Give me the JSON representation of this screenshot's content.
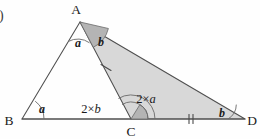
{
  "figure": {
    "kind": "geometry-diagram",
    "list_marker": ")",
    "background_color": "#fefefe",
    "line_color": "#4f4f4f",
    "shade_color": "#d8d8d8",
    "shade_dark_color": "#b4b4b4",
    "vertices": [
      {
        "id": "A",
        "label": "A",
        "x": 80,
        "y": 22,
        "label_x": 76,
        "label_y": 14
      },
      {
        "id": "B",
        "label": "B",
        "x": 22,
        "y": 119,
        "label_x": 7,
        "label_y": 124
      },
      {
        "id": "C",
        "label": "C",
        "x": 131,
        "y": 119,
        "label_x": 127,
        "label_y": 136
      },
      {
        "id": "D",
        "label": "D",
        "x": 245,
        "y": 119,
        "label_x": 249,
        "label_y": 124
      }
    ],
    "angles": [
      {
        "id": "angle-a-at-A",
        "label": "a",
        "style": "italic-bold",
        "x": 78,
        "y": 47
      },
      {
        "id": "angle-b-at-A",
        "label": "b",
        "style": "italic-bold",
        "x": 101,
        "y": 45
      },
      {
        "id": "angle-a-at-B",
        "label": "a",
        "style": "italic-bold",
        "x": 42,
        "y": 112
      },
      {
        "id": "angle-2b-at-C",
        "label": "2×b",
        "style": "plain-with-italic-var",
        "prefix": "2×",
        "variable": "b",
        "x": 90,
        "y": 113
      },
      {
        "id": "angle-2a-at-C",
        "label": "2×a",
        "style": "plain-with-italic-var",
        "prefix": "2×",
        "variable": "a",
        "x": 145,
        "y": 103
      },
      {
        "id": "angle-b-at-D",
        "label": "b",
        "style": "italic-bold",
        "x": 221,
        "y": 116
      }
    ],
    "tick_marks": [
      {
        "id": "tick-segment-AC",
        "segment": "A-C",
        "count": 1
      },
      {
        "id": "tick-segment-CD",
        "segment": "C-D",
        "count": 2
      }
    ],
    "shaded_region": "A-C-D"
  }
}
